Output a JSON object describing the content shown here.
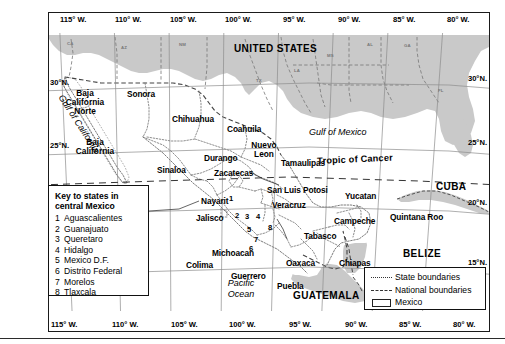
{
  "figure": {
    "title_visible": false,
    "type": "reference-map",
    "region": "Mexico and surrounding countries"
  },
  "map": {
    "projection_note": "geographic grid",
    "longitude_labels": [
      "115° W.",
      "110° W.",
      "105° W.",
      "100° W.",
      "95° W.",
      "90° W.",
      "85° W.",
      "80° W."
    ],
    "latitude_labels": [
      "30°N.",
      "25°N.",
      "20°N.",
      "15°N."
    ],
    "tropic_label": "Tropic of Cancer",
    "oceans": [
      {
        "name": "Gulf of California"
      },
      {
        "name": "Gulf of Mexico"
      },
      {
        "name": "Pacific Ocean",
        "line1": "Pacific",
        "line2": "Ocean"
      }
    ],
    "countries": [
      {
        "name": "UNITED STATES"
      },
      {
        "name": "CUBA"
      },
      {
        "name": "BELIZE"
      },
      {
        "name": "GUATEMALA"
      }
    ],
    "us_state_abbrevs": [
      "CA",
      "AZ",
      "NM",
      "TX",
      "LA",
      "MS",
      "AL",
      "GA",
      "FL"
    ],
    "mexican_states": [
      {
        "name": "Baja California Norte",
        "line1": "Baja",
        "line2": "California",
        "line3": "Norte"
      },
      {
        "name": "Baja California",
        "line1": "Baja",
        "line2": "California"
      },
      {
        "name": "Sonora"
      },
      {
        "name": "Chihuahua"
      },
      {
        "name": "Coahuila"
      },
      {
        "name": "Nuevo Leon",
        "line1": "Nuevo",
        "line2": "Leon"
      },
      {
        "name": "Tamaulipas"
      },
      {
        "name": "Sinaloa"
      },
      {
        "name": "Durango"
      },
      {
        "name": "Zacatecas"
      },
      {
        "name": "San Luis Potosi"
      },
      {
        "name": "Nayarit"
      },
      {
        "name": "Jalisco"
      },
      {
        "name": "Colima"
      },
      {
        "name": "Michoacan"
      },
      {
        "name": "Guerrero"
      },
      {
        "name": "Puebla"
      },
      {
        "name": "Veracruz"
      },
      {
        "name": "Oaxaca"
      },
      {
        "name": "Tabasco"
      },
      {
        "name": "Chiapas"
      },
      {
        "name": "Campeche"
      },
      {
        "name": "Yucatan"
      },
      {
        "name": "Quintana Roo"
      }
    ],
    "numbered_markers": [
      "1",
      "2",
      "3",
      "4",
      "5",
      "6",
      "7",
      "8"
    ]
  },
  "key_box": {
    "title_line1": "Key to states in",
    "title_line2": "central Mexico",
    "items": [
      {
        "number": "1",
        "label": "Aguascalientes"
      },
      {
        "number": "2",
        "label": "Guanajuato"
      },
      {
        "number": "3",
        "label": "Queretaro"
      },
      {
        "number": "4",
        "label": "Hidalgo"
      },
      {
        "number": "5",
        "label": "Mexico D.F."
      },
      {
        "number": "6",
        "label": "Distrito Federal"
      },
      {
        "number": "7",
        "label": "Morelos"
      },
      {
        "number": "8",
        "label": "Tlaxcala"
      }
    ]
  },
  "legend_box": {
    "rows": [
      {
        "symbol": "dotted-line",
        "label": "State boundaries"
      },
      {
        "symbol": "dashed-line",
        "label": "National boundaries"
      },
      {
        "symbol": "white-rectangle",
        "label": "Mexico"
      }
    ]
  },
  "colors": {
    "non_mexico_land": "#c9c9c9",
    "mexico_land": "#ffffff",
    "water": "#ffffff",
    "frame": "#1a1a1a",
    "boundary": "#555555",
    "text": "#000000"
  }
}
